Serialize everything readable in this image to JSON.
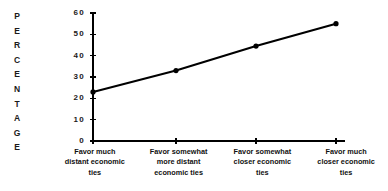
{
  "chart_data": {
    "type": "line",
    "title": "",
    "xlabel": "",
    "ylabel": "PERCENTAGE",
    "categories": [
      "Favor much distant economic ties",
      "Favor somewhat more distant economic ties",
      "Favor somewhat closer economic ties",
      "Favor much closer economic ties"
    ],
    "values": [
      23,
      33,
      44.5,
      55
    ],
    "ylim": [
      0,
      60
    ],
    "yticks": [
      0,
      10,
      20,
      30,
      40,
      50,
      60
    ],
    "ytick_labels": [
      "0",
      "10",
      "20",
      "30",
      "40",
      "50",
      "60"
    ],
    "grid": false,
    "legend": false,
    "line_color": "#000000",
    "marker": "circle",
    "marker_color": "#000000",
    "background": "#ffffff"
  },
  "axis": {
    "y_title_letters": [
      "P",
      "E",
      "R",
      "C",
      "E",
      "N",
      "T",
      "A",
      "G",
      "E"
    ]
  },
  "x_labels": [
    {
      "line1": "Favor much",
      "line2": "distant economic",
      "line3": "ties"
    },
    {
      "line1": "Favor somewhat",
      "line2": "more distant",
      "line3": "economic ties"
    },
    {
      "line1": "Favor somewhat",
      "line2": "closer economic",
      "line3": "ties"
    },
    {
      "line1": "Favor much",
      "line2": "closer economic",
      "line3": "ties"
    }
  ]
}
